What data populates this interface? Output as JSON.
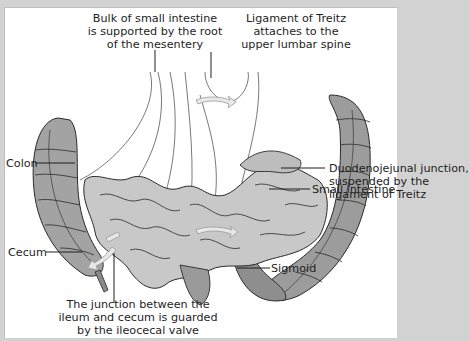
{
  "figure": {
    "labels": {
      "mesentery": [
        "Bulk of small intestine",
        "is supported by the root",
        "of the mesentery"
      ],
      "treitz": [
        "Ligament of Treitz",
        "attaches to the",
        "upper lumbar spine"
      ],
      "duodenojejunal": [
        "Duodenojejunal junction,",
        "suspended by the",
        "ligament of Treitz"
      ],
      "colon": "Colon",
      "small_intestine": "Small intestine",
      "cecum": "Cecum",
      "sigmoid": "Sigmoid",
      "ileocecal": [
        "The junction between the",
        "ileum and cecum is guarded",
        "by the ileocecal valve"
      ]
    },
    "colors": {
      "background": "#d2d2d2",
      "panel": "#ffffff",
      "colon_fill": "#9a9a9a",
      "small_intestine_fill": "#c4c4c4",
      "outline": "#2a2a2a",
      "arrow": "#e6e6e6"
    }
  }
}
